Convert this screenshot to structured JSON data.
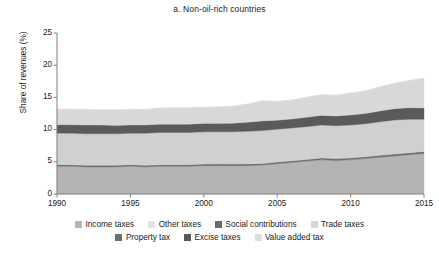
{
  "chart_data": {
    "type": "area",
    "title": "a. Non-oil-rich countries",
    "xlabel": "",
    "ylabel": "Share of revenues (%)",
    "xlim": [
      1990,
      2015
    ],
    "ylim": [
      0,
      25
    ],
    "ytick_labels": [
      "0",
      "5",
      "10",
      "15",
      "20",
      "25"
    ],
    "ytick_values": [
      0,
      5,
      10,
      15,
      20,
      25
    ],
    "xtick_labels": [
      "1990",
      "1995",
      "2000",
      "2005",
      "2010",
      "2015"
    ],
    "xtick_values": [
      1990,
      1995,
      2000,
      2005,
      2010,
      2015
    ],
    "grid": false,
    "stacked": true,
    "legend_position": "bottom",
    "x": [
      1990,
      1991,
      1992,
      1993,
      1994,
      1995,
      1996,
      1997,
      1998,
      1999,
      2000,
      2001,
      2002,
      2003,
      2004,
      2005,
      2006,
      2007,
      2008,
      2009,
      2010,
      2011,
      2012,
      2013,
      2014,
      2015
    ],
    "series": [
      {
        "name": "Income taxes",
        "color": "#b4b4b4",
        "values": [
          4.3,
          4.3,
          4.2,
          4.2,
          4.2,
          4.3,
          4.2,
          4.3,
          4.3,
          4.3,
          4.4,
          4.4,
          4.4,
          4.4,
          4.5,
          4.7,
          4.9,
          5.1,
          5.3,
          5.2,
          5.3,
          5.5,
          5.7,
          5.9,
          6.1,
          6.3
        ]
      },
      {
        "name": "Property tax",
        "color": "#6e6e6e",
        "values": [
          0.25,
          0.25,
          0.25,
          0.25,
          0.25,
          0.25,
          0.25,
          0.25,
          0.25,
          0.25,
          0.25,
          0.25,
          0.25,
          0.25,
          0.25,
          0.25,
          0.25,
          0.25,
          0.3,
          0.3,
          0.3,
          0.3,
          0.3,
          0.3,
          0.3,
          0.3
        ]
      },
      {
        "name": "Other taxes",
        "color": "#d0d0d0",
        "values": [
          4.9,
          4.9,
          4.9,
          4.9,
          4.9,
          4.9,
          5.0,
          5.0,
          5.0,
          5.0,
          5.0,
          5.0,
          5.0,
          5.1,
          5.1,
          5.1,
          5.1,
          5.1,
          5.1,
          5.1,
          5.1,
          5.1,
          5.2,
          5.3,
          5.2,
          5.0
        ]
      },
      {
        "name": "Excise taxes",
        "color": "#5a5a5a",
        "values": [
          1.3,
          1.3,
          1.35,
          1.35,
          1.3,
          1.25,
          1.25,
          1.3,
          1.3,
          1.3,
          1.3,
          1.3,
          1.35,
          1.4,
          1.5,
          1.4,
          1.4,
          1.45,
          1.5,
          1.5,
          1.55,
          1.6,
          1.7,
          1.75,
          1.8,
          1.75
        ]
      },
      {
        "name": "Social contributions",
        "color": "#4a4a4a",
        "values": [
          0.0,
          0.0,
          0.0,
          0.0,
          0.0,
          0.0,
          0.0,
          0.0,
          0.0,
          0.0,
          0.0,
          0.0,
          0.0,
          0.0,
          0.0,
          0.0,
          0.0,
          0.0,
          0.0,
          0.0,
          0.0,
          0.0,
          0.0,
          0.0,
          0.0,
          0.0
        ]
      },
      {
        "name": "Value added tax",
        "color": "#d8d8d8",
        "values": [
          2.4,
          2.4,
          2.4,
          2.35,
          2.4,
          2.4,
          2.4,
          2.45,
          2.5,
          2.5,
          2.5,
          2.55,
          2.6,
          2.8,
          3.1,
          2.9,
          2.9,
          3.1,
          3.2,
          3.2,
          3.4,
          3.5,
          3.7,
          3.9,
          4.2,
          4.6
        ]
      },
      {
        "name": "Trade taxes",
        "color": "#dcdcdc",
        "values": [
          0.05,
          0.05,
          0.05,
          0.05,
          0.05,
          0.05,
          0.05,
          0.05,
          0.05,
          0.05,
          0.05,
          0.05,
          0.05,
          0.05,
          0.05,
          0.05,
          0.05,
          0.05,
          0.05,
          0.05,
          0.05,
          0.05,
          0.05,
          0.05,
          0.05,
          0.05
        ]
      }
    ],
    "stack_totals": [
      13.2,
      13.2,
      13.15,
      13.1,
      13.1,
      13.15,
      13.15,
      13.35,
      13.4,
      13.4,
      13.5,
      13.55,
      13.65,
      13.95,
      14.5,
      14.4,
      14.55,
      15.05,
      15.45,
      15.35,
      15.7,
      16.05,
      16.65,
      17.2,
      17.65,
      18.0
    ]
  },
  "legend": {
    "rows": [
      [
        {
          "label": "Income taxes",
          "color": "#b4b4b4"
        },
        {
          "label": "Other taxes",
          "color": "#e2e2e2"
        },
        {
          "label": "Social contributions",
          "color": "#6b6b6b"
        },
        {
          "label": "Trade taxes",
          "color": "#d6d6d6"
        }
      ],
      [
        {
          "label": "Property tax",
          "color": "#6e6e6e"
        },
        {
          "label": "Excise taxes",
          "color": "#595959"
        },
        {
          "label": "Value added tax",
          "color": "#dcdcdc"
        }
      ]
    ]
  },
  "axis": {
    "line_color": "#808080"
  }
}
